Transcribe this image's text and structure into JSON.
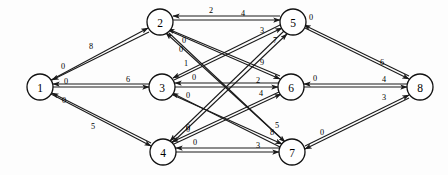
{
  "diagram": {
    "type": "directed-graph",
    "background_color": "#fdfdfd",
    "node_fill": "#ffffff",
    "stroke_color": "#1a1a1a"
  },
  "nodes": [
    {
      "id": "1",
      "label": "1",
      "x": 40,
      "y": 87,
      "r": 13
    },
    {
      "id": "2",
      "label": "2",
      "x": 160,
      "y": 22,
      "r": 13
    },
    {
      "id": "3",
      "label": "3",
      "x": 162,
      "y": 87,
      "r": 13
    },
    {
      "id": "4",
      "label": "4",
      "x": 163,
      "y": 152,
      "r": 13
    },
    {
      "id": "5",
      "label": "5",
      "x": 293,
      "y": 22,
      "r": 13
    },
    {
      "id": "6",
      "label": "6",
      "x": 291,
      "y": 87,
      "r": 13
    },
    {
      "id": "7",
      "label": "7",
      "x": 292,
      "y": 152,
      "r": 13
    },
    {
      "id": "8",
      "label": "8",
      "x": 420,
      "y": 87,
      "r": 13
    }
  ],
  "edges": [
    {
      "id": "e1_2",
      "from": "1",
      "to": "2",
      "weight": "8",
      "x1": 51,
      "y1": 80,
      "x2": 148,
      "y2": 28,
      "lx": 91,
      "ly": 46
    },
    {
      "id": "e2_1",
      "from": "2",
      "to": "1",
      "weight": "0",
      "x1": 149,
      "y1": 32,
      "x2": 52,
      "y2": 80,
      "lx": 63,
      "ly": 66
    },
    {
      "id": "e1_3",
      "from": "1",
      "to": "3",
      "weight": "6",
      "x1": 53,
      "y1": 87,
      "x2": 149,
      "y2": 87,
      "lx": 128,
      "ly": 79
    },
    {
      "id": "e3_1",
      "from": "3",
      "to": "1",
      "weight": "0",
      "x1": 149,
      "y1": 84,
      "x2": 53,
      "y2": 84,
      "lx": 66,
      "ly": 81
    },
    {
      "id": "e1_4",
      "from": "1",
      "to": "4",
      "weight": "5",
      "x1": 51,
      "y1": 94,
      "x2": 151,
      "y2": 146,
      "lx": 93,
      "ly": 126
    },
    {
      "id": "e4_1",
      "from": "4",
      "to": "1",
      "weight": "0",
      "x1": 151,
      "y1": 143,
      "x2": 52,
      "y2": 93,
      "lx": 64,
      "ly": 100
    },
    {
      "id": "e2_5",
      "from": "2",
      "to": "5",
      "weight": "4",
      "x1": 173,
      "y1": 20,
      "x2": 280,
      "y2": 20,
      "lx": 243,
      "ly": 13
    },
    {
      "id": "e5_2",
      "from": "5",
      "to": "2",
      "weight": "2",
      "x1": 280,
      "y1": 16,
      "x2": 173,
      "y2": 16,
      "lx": 211,
      "ly": 10
    },
    {
      "id": "e3_6",
      "from": "3",
      "to": "6",
      "weight": "2",
      "x1": 175,
      "y1": 87,
      "x2": 278,
      "y2": 87,
      "lx": 258,
      "ly": 80
    },
    {
      "id": "e6_3",
      "from": "6",
      "to": "3",
      "weight": "0",
      "x1": 278,
      "y1": 83,
      "x2": 175,
      "y2": 83,
      "lx": 194,
      "ly": 77
    },
    {
      "id": "e4_7",
      "from": "4",
      "to": "7",
      "weight": "3",
      "x1": 176,
      "y1": 152,
      "x2": 279,
      "y2": 152,
      "lx": 258,
      "ly": 145
    },
    {
      "id": "e7_4",
      "from": "7",
      "to": "4",
      "weight": "0",
      "x1": 279,
      "y1": 148,
      "x2": 176,
      "y2": 148,
      "lx": 195,
      "ly": 142
    },
    {
      "id": "e3_5",
      "from": "3",
      "to": "5",
      "weight": "3",
      "x1": 174,
      "y1": 80,
      "x2": 282,
      "y2": 28,
      "lx": 262,
      "ly": 30
    },
    {
      "id": "e5_3",
      "from": "5",
      "to": "3",
      "weight": "1",
      "x1": 282,
      "y1": 24,
      "x2": 173,
      "y2": 78,
      "lx": 186,
      "ly": 63
    },
    {
      "id": "e4_5",
      "from": "4",
      "to": "5",
      "weight": "7",
      "x1": 172,
      "y1": 143,
      "x2": 287,
      "y2": 34,
      "lx": 275,
      "ly": 40
    },
    {
      "id": "e5_4",
      "from": "5",
      "to": "4",
      "weight": "0",
      "x1": 284,
      "y1": 31,
      "x2": 170,
      "y2": 141,
      "lx": 188,
      "ly": 127
    },
    {
      "id": "e2_6",
      "from": "2",
      "to": "6",
      "weight": "9",
      "x1": 170,
      "y1": 31,
      "x2": 280,
      "y2": 79,
      "lx": 262,
      "ly": 62
    },
    {
      "id": "e6_2",
      "from": "6",
      "to": "2",
      "weight": "0",
      "x1": 280,
      "y1": 76,
      "x2": 168,
      "y2": 29,
      "lx": 184,
      "ly": 40
    },
    {
      "id": "e4_6",
      "from": "4",
      "to": "6",
      "weight": "4",
      "x1": 174,
      "y1": 144,
      "x2": 281,
      "y2": 94,
      "lx": 261,
      "ly": 93
    },
    {
      "id": "e6_4",
      "from": "6",
      "to": "4",
      "weight": "0",
      "x1": 279,
      "y1": 92,
      "x2": 172,
      "y2": 142,
      "lx": 188,
      "ly": 129
    },
    {
      "id": "e2_7",
      "from": "2",
      "to": "7",
      "weight": "8",
      "x1": 169,
      "y1": 33,
      "x2": 285,
      "y2": 142,
      "lx": 272,
      "ly": 132
    },
    {
      "id": "e7_2",
      "from": "7",
      "to": "2",
      "weight": "0",
      "x1": 283,
      "y1": 140,
      "x2": 166,
      "y2": 33,
      "lx": 181,
      "ly": 49
    },
    {
      "id": "e3_7",
      "from": "3",
      "to": "7",
      "weight": "5",
      "x1": 173,
      "y1": 95,
      "x2": 282,
      "y2": 144,
      "lx": 277,
      "ly": 125
    },
    {
      "id": "e7_3",
      "from": "7",
      "to": "3",
      "weight": "0",
      "x1": 280,
      "y1": 147,
      "x2": 172,
      "y2": 93,
      "lx": 188,
      "ly": 95
    },
    {
      "id": "e5_8",
      "from": "5",
      "to": "8",
      "weight": "6",
      "x1": 305,
      "y1": 28,
      "x2": 409,
      "y2": 79,
      "lx": 382,
      "ly": 62
    },
    {
      "id": "e8_5",
      "from": "8",
      "to": "5",
      "weight": "0",
      "x1": 409,
      "y1": 76,
      "x2": 304,
      "y2": 25,
      "lx": 311,
      "ly": 17
    },
    {
      "id": "e6_8",
      "from": "6",
      "to": "8",
      "weight": "4",
      "x1": 304,
      "y1": 87,
      "x2": 407,
      "y2": 87,
      "lx": 384,
      "ly": 79
    },
    {
      "id": "e8_6",
      "from": "8",
      "to": "6",
      "weight": "0",
      "x1": 407,
      "y1": 84,
      "x2": 304,
      "y2": 84,
      "lx": 315,
      "ly": 78
    },
    {
      "id": "e7_8",
      "from": "7",
      "to": "8",
      "weight": "3",
      "x1": 305,
      "y1": 146,
      "x2": 409,
      "y2": 95,
      "lx": 384,
      "ly": 97
    },
    {
      "id": "e8_7",
      "from": "8",
      "to": "7",
      "weight": "0",
      "x1": 409,
      "y1": 98,
      "x2": 305,
      "y2": 149,
      "lx": 322,
      "ly": 132
    }
  ]
}
